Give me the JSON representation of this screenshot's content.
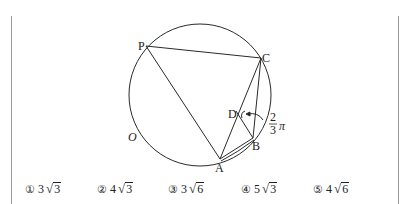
{
  "figure": {
    "circle_label": "O",
    "points": {
      "P": {
        "label": "P",
        "x": 146,
        "y": 46
      },
      "C": {
        "label": "C",
        "x": 261,
        "y": 58
      },
      "D": {
        "label": "D",
        "x": 240,
        "y": 114
      },
      "B": {
        "label": "B",
        "x": 253,
        "y": 138
      },
      "A": {
        "label": "A",
        "x": 220,
        "y": 159
      }
    },
    "angle_label_num": "2",
    "angle_label_den": "3",
    "angle_label_pi": "π",
    "stroke_color": "#2a2a2a"
  },
  "choices": [
    {
      "num": "①",
      "coef": "3",
      "radicand": "3"
    },
    {
      "num": "②",
      "coef": "4",
      "radicand": "3"
    },
    {
      "num": "③",
      "coef": "3",
      "radicand": "6"
    },
    {
      "num": "④",
      "coef": "5",
      "radicand": "3"
    },
    {
      "num": "⑤",
      "coef": "4",
      "radicand": "6"
    }
  ]
}
